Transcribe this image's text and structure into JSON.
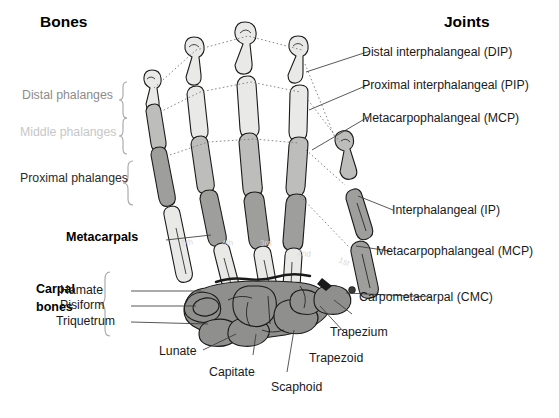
{
  "figure": {
    "title_left": "Bones",
    "title_right": "Joints"
  },
  "bones_column": {
    "heading": "Bones",
    "bracket_labels": [
      {
        "text": "Distal phalanges",
        "tone": "mid-gray"
      },
      {
        "text": "Middle phalanges",
        "tone": "light-gray"
      },
      {
        "text": "Proximal phalanges",
        "tone": "dark"
      }
    ],
    "group_labels": [
      {
        "text": "Metacarpals",
        "style": "bold"
      },
      {
        "text": "Carpal",
        "style": "bold"
      },
      {
        "text": "bones",
        "style": "bold"
      }
    ]
  },
  "joints_column": {
    "heading": "Joints",
    "items": [
      "Distal interphalangeal (DIP)",
      "Proximal interphalangeal (PIP)",
      "Metacarpophalangeal (MCP)",
      "Interphalangeal (IP)",
      "Metacarpophalangeal (MCP)",
      "Carpometacarpal (CMC)"
    ]
  },
  "carpal_bones": {
    "left_labels": [
      "Hamate",
      "Pisiform",
      "Triquetrum"
    ],
    "bottom_labels": [
      "Lunate",
      "Capitate",
      "Scaphoid",
      "Trapezoid",
      "Trapezium"
    ]
  },
  "metacarpal_numbers": [
    "5th",
    "4th",
    "3rd",
    "2nd",
    "1st"
  ],
  "colors": {
    "bone_light": "#e8e8e6",
    "bone_mid": "#bcbcba",
    "bone_dark": "#9a9a98",
    "carpal": "#8f8f8d",
    "outline": "#1a1a1a",
    "leader": "#3a3a3a",
    "bracket": "#9a9a9a",
    "text": "#1a1a1a",
    "distal_label": "#8c8c8c",
    "middle_label": "#c7c7c7"
  }
}
